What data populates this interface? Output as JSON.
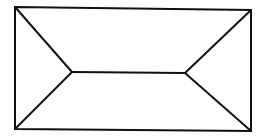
{
  "diagram": {
    "stroke_color": "#111111",
    "background": "#ffffff",
    "outer_rect": {
      "top_left": [
        15,
        7
      ],
      "top_right": [
        251,
        10
      ],
      "bottom_right": [
        251,
        131
      ],
      "bottom_left": [
        15,
        129
      ]
    },
    "inner_vertices": {
      "left": [
        72,
        72
      ],
      "right": [
        185,
        73
      ]
    }
  }
}
